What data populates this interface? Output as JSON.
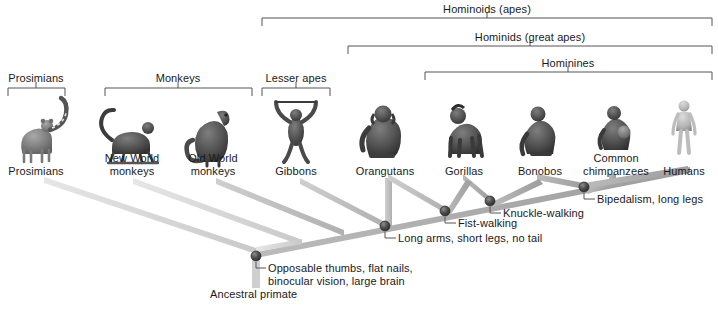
{
  "figure": {
    "title_visible": false,
    "type": "phylogenetic-tree",
    "background": "#ffffff",
    "ink": "#1a1a1a"
  },
  "group_brackets": [
    {
      "id": "prosimians",
      "label": "Prosimians",
      "x1": 8,
      "x2": 65,
      "y": 88,
      "label_y": 72
    },
    {
      "id": "monkeys",
      "label": "Monkeys",
      "x1": 105,
      "x2": 252,
      "y": 88,
      "label_y": 72
    },
    {
      "id": "lesser-apes",
      "label": "Lesser apes",
      "x1": 262,
      "x2": 330,
      "y": 88,
      "label_y": 72
    },
    {
      "id": "hominoids",
      "label": "Hominoids (apes)",
      "x1": 262,
      "x2": 712,
      "y": 18,
      "label_y": 3
    },
    {
      "id": "hominids",
      "label": "Hominids (great apes)",
      "x1": 348,
      "x2": 712,
      "y": 46,
      "label_y": 31
    },
    {
      "id": "hominines",
      "label": "Hominines",
      "x1": 425,
      "x2": 712,
      "y": 72,
      "label_y": 57
    }
  ],
  "taxa": [
    {
      "id": "prosimians",
      "label": "Prosimians",
      "label_lines": [
        "Prosimians"
      ],
      "x": 36,
      "label_y": 165,
      "icon": "lemur-silhouette",
      "tip_x": 44,
      "tip_y": 181
    },
    {
      "id": "new-world-monkeys",
      "label": "New World monkeys",
      "label_lines": [
        "New World",
        "monkeys"
      ],
      "x": 132,
      "label_y": 152,
      "icon": "spider-monkey-silhouette",
      "tip_x": 133,
      "tip_y": 181
    },
    {
      "id": "old-world-monkeys",
      "label": "Old World monkeys",
      "label_lines": [
        "Old World",
        "monkeys"
      ],
      "x": 213,
      "label_y": 152,
      "icon": "macaque-silhouette",
      "tip_x": 216,
      "tip_y": 181
    },
    {
      "id": "gibbons",
      "label": "Gibbons",
      "label_lines": [
        "Gibbons"
      ],
      "x": 296,
      "label_y": 165,
      "icon": "gibbon-silhouette",
      "tip_x": 300,
      "tip_y": 181
    },
    {
      "id": "orangutans",
      "label": "Orangutans",
      "label_lines": [
        "Orangutans"
      ],
      "x": 385,
      "label_y": 165,
      "icon": "orangutan-silhouette",
      "tip_x": 385,
      "tip_y": 178
    },
    {
      "id": "gorillas",
      "label": "Gorillas",
      "label_lines": [
        "Gorillas"
      ],
      "x": 464,
      "label_y": 165,
      "icon": "gorilla-silhouette",
      "tip_x": 462,
      "tip_y": 177
    },
    {
      "id": "bonobos",
      "label": "Bonobos",
      "label_lines": [
        "Bonobos"
      ],
      "x": 540,
      "label_y": 165,
      "icon": "bonobo-silhouette",
      "tip_x": 536,
      "tip_y": 177
    },
    {
      "id": "common-chimpanzees",
      "label": "Common chimpanzees",
      "label_lines": [
        "Common",
        "chimpanzees"
      ],
      "x": 616,
      "label_y": 152,
      "icon": "chimpanzee-silhouette",
      "tip_x": 612,
      "tip_y": 176
    },
    {
      "id": "humans",
      "label": "Humans",
      "label_lines": [
        "Humans"
      ],
      "x": 684,
      "label_y": 165,
      "icon": "human-silhouette",
      "tip_x": 686,
      "tip_y": 172
    }
  ],
  "nodes": [
    {
      "id": "root",
      "x": 256,
      "y": 256,
      "annotation": [
        "Opposable thumbs, flat nails,",
        "binocular vision, large brain"
      ],
      "annot_x": 268,
      "annot_y": 262,
      "leader": true
    },
    {
      "id": "hominoid-node",
      "x": 385,
      "y": 226,
      "annotation": [
        "Long arms, short legs, no tail"
      ],
      "annot_x": 398,
      "annot_y": 232,
      "leader": true
    },
    {
      "id": "hominid-node",
      "x": 445,
      "y": 211,
      "annotation": [
        "Fist-walking"
      ],
      "annot_x": 458,
      "annot_y": 217,
      "leader": true
    },
    {
      "id": "hominine-node",
      "x": 490,
      "y": 201,
      "annotation": [
        "Knuckle-walking"
      ],
      "annot_x": 503,
      "annot_y": 207,
      "leader": true
    },
    {
      "id": "human-chimp-node",
      "x": 584,
      "y": 187,
      "annotation": [
        "Bipedalism, long legs"
      ],
      "annot_x": 597,
      "annot_y": 193,
      "leader": true
    }
  ],
  "root_label": {
    "text": "Ancestral primate",
    "x": 210,
    "y": 288
  },
  "colors": {
    "branch_light": "#d4d4d4",
    "branch_mid": "#bdbdbd",
    "branch_dark": "#9a9a9a",
    "node_fill": "#4a4a4a",
    "bracket": "#555555",
    "text": "#1a1a1a"
  },
  "tree_structure": {
    "description": "Perspective-style cladogram; trunk rises from root to the right along a spine, each taxon branching up-left to its tip.",
    "spine": [
      [
        256,
        256
      ],
      [
        686,
        172
      ]
    ],
    "branches": [
      {
        "from": "root",
        "to": "prosimians"
      },
      {
        "from": "root",
        "to": "new-world-monkeys"
      },
      {
        "from": "catarrhine",
        "to": "old-world-monkeys"
      },
      {
        "from": "hominoid-node",
        "to": "gibbons"
      },
      {
        "from": "hominoid-node",
        "to": "orangutans"
      },
      {
        "from": "hominid-node",
        "to": "gorillas"
      },
      {
        "from": "hominine-node",
        "to": "bonobos"
      },
      {
        "from": "human-chimp-node",
        "to": "common-chimpanzees"
      },
      {
        "from": "human-chimp-node",
        "to": "humans"
      }
    ]
  }
}
